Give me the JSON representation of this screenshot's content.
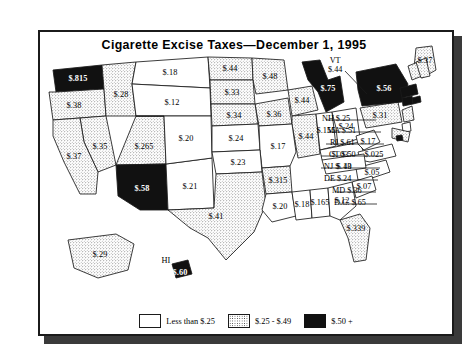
{
  "title": "Cigarette Excise Taxes—December 1, 1995",
  "legend": {
    "items": [
      {
        "swatch": "white",
        "label": "Less than $.25"
      },
      {
        "swatch": "stipple",
        "label": "$.25 - $.49"
      },
      {
        "swatch": "black",
        "label": "$.50 +"
      }
    ]
  },
  "chart_data": {
    "type": "map",
    "title": "Cigarette Excise Taxes—December 1, 1995",
    "unit": "dollars per pack",
    "categories": [
      "Less than $.25",
      "$.25 - $.49",
      "$.50 +"
    ],
    "legend_position": "bottom-center",
    "states": [
      {
        "code": "WA",
        "name": "Washington",
        "value": 0.815,
        "label": "$.815",
        "class": "black"
      },
      {
        "code": "OR",
        "name": "Oregon",
        "value": 0.38,
        "label": "$.38",
        "class": "stipple"
      },
      {
        "code": "ID",
        "name": "Idaho",
        "value": 0.28,
        "label": "$.28",
        "class": "stipple"
      },
      {
        "code": "MT",
        "name": "Montana",
        "value": 0.18,
        "label": "$.18",
        "class": "white"
      },
      {
        "code": "ND",
        "name": "North Dakota",
        "value": 0.44,
        "label": "$.44",
        "class": "stipple"
      },
      {
        "code": "MN",
        "name": "Minnesota",
        "value": 0.48,
        "label": "$.48",
        "class": "stipple"
      },
      {
        "code": "WI",
        "name": "Wisconsin",
        "value": 0.44,
        "label": "$.44",
        "class": "stipple"
      },
      {
        "code": "MI",
        "name": "Michigan",
        "value": 0.75,
        "label": "$.75",
        "class": "black"
      },
      {
        "code": "NV",
        "name": "Nevada",
        "value": 0.35,
        "label": "$.35",
        "class": "stipple"
      },
      {
        "code": "UT",
        "name": "Utah",
        "value": 0.265,
        "label": "$.265",
        "class": "stipple"
      },
      {
        "code": "WY",
        "name": "Wyoming",
        "value": 0.12,
        "label": "$.12",
        "class": "white"
      },
      {
        "code": "SD",
        "name": "South Dakota",
        "value": 0.33,
        "label": "$.33",
        "class": "stipple"
      },
      {
        "code": "IA",
        "name": "Iowa",
        "value": 0.36,
        "label": "$.36",
        "class": "stipple"
      },
      {
        "code": "IL",
        "name": "Illinois",
        "value": 0.44,
        "label": "$.44",
        "class": "stipple"
      },
      {
        "code": "IN",
        "name": "Indiana",
        "value": 0.155,
        "label": "$.155",
        "class": "white"
      },
      {
        "code": "OH",
        "name": "Ohio",
        "value": 0.24,
        "label": "$.24",
        "class": "white"
      },
      {
        "code": "CA",
        "name": "California",
        "value": 0.37,
        "label": "$.37",
        "class": "stipple"
      },
      {
        "code": "AZ",
        "name": "Arizona",
        "value": 0.58,
        "label": "$.58",
        "class": "black"
      },
      {
        "code": "NM",
        "name": "New Mexico",
        "value": 0.21,
        "label": "$.21",
        "class": "white"
      },
      {
        "code": "CO",
        "name": "Colorado",
        "value": 0.2,
        "label": "$.20",
        "class": "white"
      },
      {
        "code": "NE",
        "name": "Nebraska",
        "value": 0.34,
        "label": "$.34",
        "class": "stipple"
      },
      {
        "code": "KS",
        "name": "Kansas",
        "value": 0.24,
        "label": "$.24",
        "class": "white"
      },
      {
        "code": "MO",
        "name": "Missouri",
        "value": 0.17,
        "label": "$.17",
        "class": "white"
      },
      {
        "code": "KY",
        "name": "Kentucky",
        "value": 0.03,
        "label": "$. 03",
        "class": "white"
      },
      {
        "code": "WV",
        "name": "West Virginia",
        "value": 0.17,
        "label": "$.17",
        "class": "white"
      },
      {
        "code": "VA",
        "name": "Virginia",
        "value": 0.025,
        "label": "$.025",
        "class": "white"
      },
      {
        "code": "NC",
        "name": "North Carolina",
        "value": 0.05,
        "label": "$.05",
        "class": "white"
      },
      {
        "code": "SC",
        "name": "South Carolina",
        "value": 0.07,
        "label": "$.07",
        "class": "white"
      },
      {
        "code": "TN",
        "name": "Tennessee",
        "value": 0.13,
        "label": "$.13",
        "class": "white"
      },
      {
        "code": "OK",
        "name": "Oklahoma",
        "value": 0.23,
        "label": "$.23",
        "class": "white"
      },
      {
        "code": "AR",
        "name": "Arkansas",
        "value": 0.315,
        "label": "$.315",
        "class": "stipple"
      },
      {
        "code": "TX",
        "name": "Texas",
        "value": 0.41,
        "label": "$.41",
        "class": "stipple"
      },
      {
        "code": "LA",
        "name": "Louisiana",
        "value": 0.2,
        "label": "$.20",
        "class": "white"
      },
      {
        "code": "MS",
        "name": "Mississippi",
        "value": 0.18,
        "label": "$.18",
        "class": "white"
      },
      {
        "code": "AL",
        "name": "Alabama",
        "value": 0.165,
        "label": "$.165",
        "class": "white"
      },
      {
        "code": "GA",
        "name": "Georgia",
        "value": 0.12,
        "label": "$.12",
        "class": "white"
      },
      {
        "code": "FL",
        "name": "Florida",
        "value": 0.339,
        "label": "$.339",
        "class": "stipple"
      },
      {
        "code": "PA",
        "name": "Pennsylvania",
        "value": 0.31,
        "label": "$.31",
        "class": "stipple"
      },
      {
        "code": "NY",
        "name": "New York",
        "value": 0.56,
        "label": "$.56",
        "class": "black"
      },
      {
        "code": "ME",
        "name": "Maine",
        "value": 0.37,
        "label": "$.37",
        "class": "stipple"
      },
      {
        "code": "AK",
        "name": "Alaska",
        "value": 0.29,
        "label": "$.29",
        "class": "stipple"
      },
      {
        "code": "HI",
        "name": "Hawaii",
        "value": 0.6,
        "label": "$.60",
        "class": "black"
      }
    ],
    "callouts": [
      {
        "code": "VT",
        "name": "Vermont",
        "value": 0.44,
        "label": "VT",
        "value_label": "$.44",
        "class": "stipple"
      },
      {
        "code": "NH",
        "name": "New Hampshire",
        "value": 0.25,
        "label": "NH $.25",
        "class": "stipple"
      },
      {
        "code": "MA",
        "name": "Massachusetts",
        "value": 0.51,
        "label": "MA $.51",
        "class": "black"
      },
      {
        "code": "RI",
        "name": "Rhode Island",
        "value": 0.61,
        "label": "RI $.61",
        "class": "black"
      },
      {
        "code": "CT",
        "name": "Connecticut",
        "value": 0.5,
        "label": "CT $.50",
        "class": "black"
      },
      {
        "code": "NJ",
        "name": "New Jersey",
        "value": 0.4,
        "label": "NJ $. 40",
        "class": "stipple"
      },
      {
        "code": "DE",
        "name": "Delaware",
        "value": 0.24,
        "label": "DE $.24",
        "class": "white"
      },
      {
        "code": "MD",
        "name": "Maryland",
        "value": 0.36,
        "label": "MD $.36",
        "class": "stipple"
      },
      {
        "code": "DC",
        "name": "District of Columbia",
        "value": 0.65,
        "label": "D.C. $.65",
        "class": "black"
      }
    ],
    "hawaii_label": "HI"
  }
}
